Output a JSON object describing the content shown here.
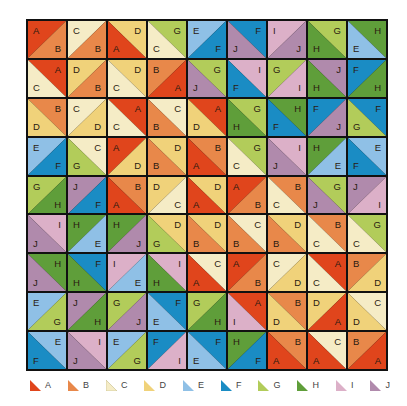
{
  "colors": {
    "A": "#e0451c",
    "B": "#e8884a",
    "C": "#f5ecc6",
    "D": "#f0d27a",
    "E": "#8fc0e6",
    "F": "#1a8cc4",
    "G": "#b2cc5a",
    "H": "#5f9e3a",
    "I": "#dcb0c8",
    "J": "#b08aac"
  },
  "legend": [
    "A",
    "B",
    "C",
    "D",
    "E",
    "F",
    "G",
    "H",
    "I",
    "J"
  ],
  "grid": [
    [
      {
        "d": "/",
        "a": "A",
        "b": "B"
      },
      {
        "d": "/",
        "a": "C",
        "b": "B"
      },
      {
        "d": "\\",
        "a": "D",
        "b": "A"
      },
      {
        "d": "\\",
        "a": "G",
        "b": "C"
      },
      {
        "d": "/",
        "a": "E",
        "b": "F"
      },
      {
        "d": "\\",
        "a": "F",
        "b": "J"
      },
      {
        "d": "/",
        "a": "I",
        "b": "J"
      },
      {
        "d": "\\",
        "a": "G",
        "b": "H"
      },
      {
        "d": "\\",
        "a": "H",
        "b": "E"
      }
    ],
    [
      {
        "d": "\\",
        "a": "A",
        "b": "C"
      },
      {
        "d": "/",
        "a": "D",
        "b": "B"
      },
      {
        "d": "\\",
        "a": "D",
        "b": "C"
      },
      {
        "d": "/",
        "a": "B",
        "b": "A"
      },
      {
        "d": "\\",
        "a": "G",
        "b": "J"
      },
      {
        "d": "\\",
        "a": "I",
        "b": "F"
      },
      {
        "d": "/",
        "a": "G",
        "b": "I"
      },
      {
        "d": "\\",
        "a": "J",
        "b": "H"
      },
      {
        "d": "/",
        "a": "F",
        "b": "H"
      }
    ],
    [
      {
        "d": "\\",
        "a": "B",
        "b": "D"
      },
      {
        "d": "/",
        "a": "C",
        "b": "D"
      },
      {
        "d": "\\",
        "a": "A",
        "b": "C"
      },
      {
        "d": "\\",
        "a": "C",
        "b": "B"
      },
      {
        "d": "\\",
        "a": "A",
        "b": "D"
      },
      {
        "d": "\\",
        "a": "G",
        "b": "H"
      },
      {
        "d": "\\",
        "a": "H",
        "b": "F"
      },
      {
        "d": "/",
        "a": "F",
        "b": "J"
      },
      {
        "d": "\\",
        "a": "F",
        "b": "G"
      }
    ],
    [
      {
        "d": "/",
        "a": "E",
        "b": "F"
      },
      {
        "d": "\\",
        "a": "C",
        "b": "G"
      },
      {
        "d": "/",
        "a": "A",
        "b": "D"
      },
      {
        "d": "\\",
        "a": "D",
        "b": "B"
      },
      {
        "d": "\\",
        "a": "B",
        "b": "A"
      },
      {
        "d": "\\",
        "a": "G",
        "b": "C"
      },
      {
        "d": "\\",
        "a": "I",
        "b": "J"
      },
      {
        "d": "/",
        "a": "H",
        "b": "E"
      },
      {
        "d": "\\",
        "a": "E",
        "b": "F"
      }
    ],
    [
      {
        "d": "/",
        "a": "G",
        "b": "H"
      },
      {
        "d": "/",
        "a": "J",
        "b": "F"
      },
      {
        "d": "\\",
        "a": "B",
        "b": "A"
      },
      {
        "d": "/",
        "a": "D",
        "b": "C"
      },
      {
        "d": "\\",
        "a": "D",
        "b": "A"
      },
      {
        "d": "/",
        "a": "A",
        "b": "B"
      },
      {
        "d": "\\",
        "a": "B",
        "b": "C"
      },
      {
        "d": "\\",
        "a": "G",
        "b": "J"
      },
      {
        "d": "/",
        "a": "J",
        "b": "I"
      }
    ],
    [
      {
        "d": "\\",
        "a": "I",
        "b": "J"
      },
      {
        "d": "/",
        "a": "H",
        "b": "E"
      },
      {
        "d": "/",
        "a": "H",
        "b": "J"
      },
      {
        "d": "\\",
        "a": "D",
        "b": "G"
      },
      {
        "d": "\\",
        "a": "D",
        "b": "B"
      },
      {
        "d": "\\",
        "a": "C",
        "b": "B"
      },
      {
        "d": "\\",
        "a": "D",
        "b": "B"
      },
      {
        "d": "\\",
        "a": "B",
        "b": "C"
      },
      {
        "d": "\\",
        "a": "G",
        "b": "C"
      }
    ],
    [
      {
        "d": "\\",
        "a": "H",
        "b": "J"
      },
      {
        "d": "\\",
        "a": "F",
        "b": "H"
      },
      {
        "d": "/",
        "a": "I",
        "b": "E"
      },
      {
        "d": "\\",
        "a": "I",
        "b": "H"
      },
      {
        "d": "\\",
        "a": "C",
        "b": "A"
      },
      {
        "d": "/",
        "a": "A",
        "b": "B"
      },
      {
        "d": "/",
        "a": "C",
        "b": "D"
      },
      {
        "d": "\\",
        "a": "A",
        "b": "C"
      },
      {
        "d": "/",
        "a": "B",
        "b": "D"
      }
    ],
    [
      {
        "d": "/",
        "a": "E",
        "b": "G"
      },
      {
        "d": "/",
        "a": "J",
        "b": "H"
      },
      {
        "d": "/",
        "a": "G",
        "b": "J"
      },
      {
        "d": "\\",
        "a": "F",
        "b": "E"
      },
      {
        "d": "/",
        "a": "G",
        "b": "H"
      },
      {
        "d": "\\",
        "a": "A",
        "b": "I"
      },
      {
        "d": "\\",
        "a": "B",
        "b": "D"
      },
      {
        "d": "/",
        "a": "D",
        "b": "A"
      },
      {
        "d": "\\",
        "a": "C",
        "b": "D"
      }
    ],
    [
      {
        "d": "\\",
        "a": "E",
        "b": "F"
      },
      {
        "d": "\\",
        "a": "I",
        "b": "J"
      },
      {
        "d": "/",
        "a": "E",
        "b": "G"
      },
      {
        "d": "/",
        "a": "F",
        "b": "I"
      },
      {
        "d": "\\",
        "a": "F",
        "b": "E"
      },
      {
        "d": "/",
        "a": "H",
        "b": "F"
      },
      {
        "d": "\\",
        "a": "B",
        "b": "A"
      },
      {
        "d": "\\",
        "a": "C",
        "b": "A"
      },
      {
        "d": "/",
        "a": "B",
        "b": "A"
      }
    ]
  ]
}
